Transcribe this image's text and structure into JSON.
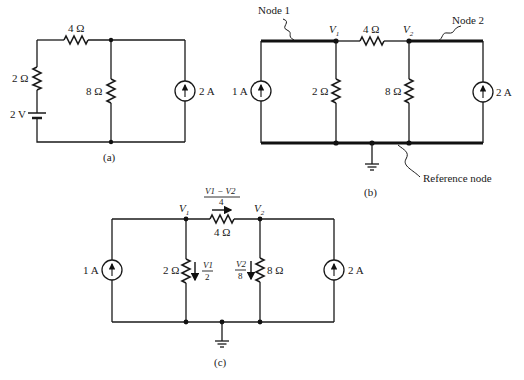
{
  "figure": {
    "circuit_a": {
      "caption": "(a)",
      "r_top": "4 Ω",
      "r_left": "2 Ω",
      "battery": "2 V",
      "r_mid": "8 Ω",
      "source": "2 A"
    },
    "circuit_b": {
      "caption": "(b)",
      "node1_label": "Node 1",
      "node2_label": "Node 2",
      "reference_label": "Reference node",
      "v1": "V",
      "v1_sub": "1",
      "v2": "V",
      "v2_sub": "2",
      "r_top": "4 Ω",
      "r_left": "2 Ω",
      "r_right": "8 Ω",
      "source_left": "1 A",
      "source_right": "2 A"
    },
    "circuit_c": {
      "caption": "(c)",
      "v1": "V",
      "v1_sub": "1",
      "v2": "V",
      "v2_sub": "2",
      "current_top_num": "V1 − V2",
      "current_top_den": "4",
      "r_top": "4 Ω",
      "r_left": "2 Ω",
      "r_right": "8 Ω",
      "current_left_num": "V1",
      "current_left_den": "2",
      "current_right_num": "V2",
      "current_right_den": "8",
      "source_left": "1 A",
      "source_right": "2 A"
    }
  }
}
